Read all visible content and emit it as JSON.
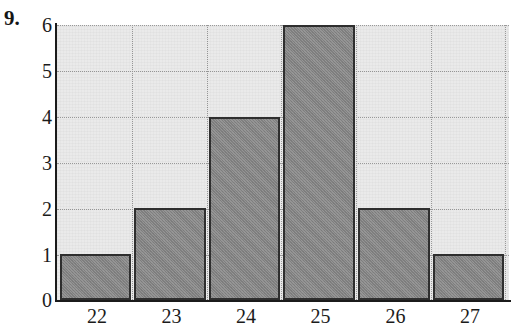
{
  "problem": {
    "number_label": "9."
  },
  "chart_data": {
    "type": "bar",
    "title": "",
    "subtitle": "",
    "xlabel": "",
    "ylabel": "",
    "categories": [
      "22",
      "23",
      "24",
      "25",
      "26",
      "27"
    ],
    "values": [
      1,
      2,
      4,
      6,
      2,
      1
    ],
    "series": [
      {
        "name": "frequency",
        "values": [
          1,
          2,
          4,
          6,
          2,
          1
        ]
      }
    ],
    "ylim": [
      0,
      6
    ],
    "y_ticks": [
      "0",
      "1",
      "2",
      "3",
      "4",
      "5",
      "6"
    ],
    "x_ticks": [
      "22",
      "23",
      "24",
      "25",
      "26",
      "27"
    ],
    "grid": true,
    "legend": "none",
    "annotations": []
  },
  "style": {
    "bar_fill": "#878787",
    "bar_border": "#2f2f2f",
    "plot_background": "#eaeaea",
    "axis_color": "#1b1b1b",
    "gridline_color": "#9a9a9a",
    "text_color": "#1b1b1b"
  }
}
